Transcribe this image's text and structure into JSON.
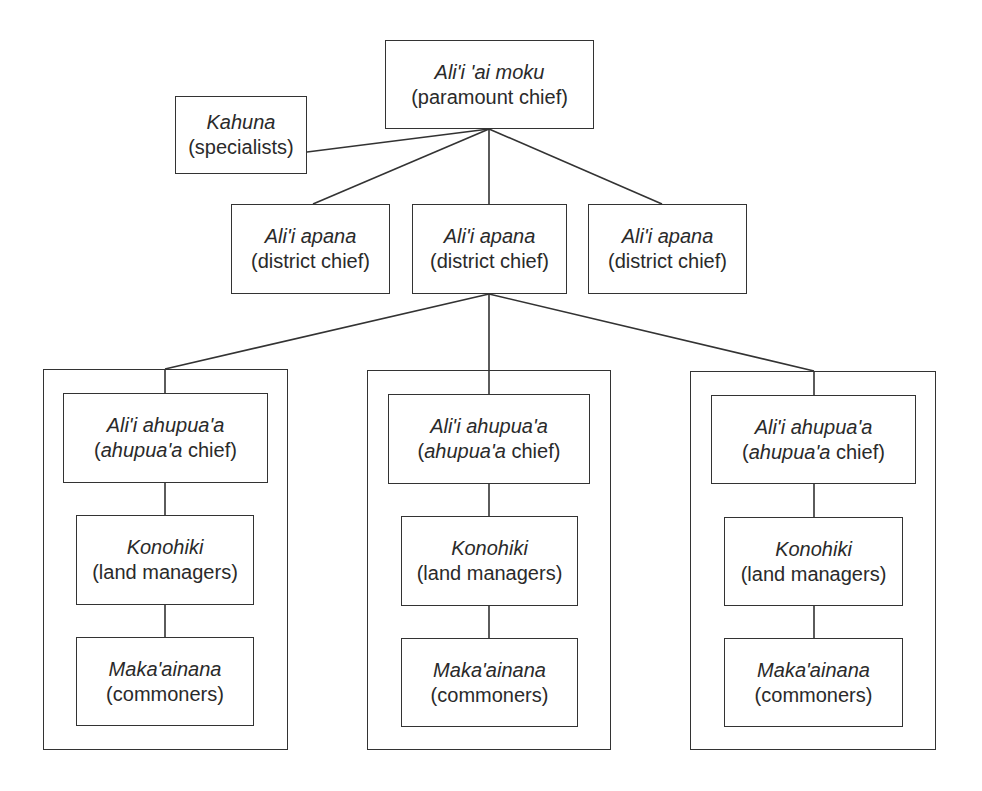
{
  "diagram": {
    "type": "hierarchy",
    "paramount": {
      "name": "Ali'i 'ai moku",
      "role": "(paramount chief)"
    },
    "kahuna": {
      "name": "Kahuna",
      "role": "(specialists)"
    },
    "districts": [
      {
        "name": "Ali'i apana",
        "role": "(district chief)"
      },
      {
        "name": "Ali'i apana",
        "role": "(district chief)"
      },
      {
        "name": "Ali'i apana",
        "role": "(district chief)"
      }
    ],
    "ahupuaa_units": [
      {
        "chief": {
          "name": "Ali'i ahupua'a",
          "role_prefix": "(",
          "role_italic": "ahupua'a",
          "role_suffix": " chief)"
        },
        "konohiki": {
          "name": "Konohiki",
          "role": "(land managers)"
        },
        "commoners": {
          "name": "Maka'ainana",
          "role": "(commoners)"
        }
      },
      {
        "chief": {
          "name": "Ali'i ahupua'a",
          "role_prefix": "(",
          "role_italic": "ahupua'a",
          "role_suffix": " chief)"
        },
        "konohiki": {
          "name": "Konohiki",
          "role": "(land managers)"
        },
        "commoners": {
          "name": "Maka'ainana",
          "role": "(commoners)"
        }
      },
      {
        "chief": {
          "name": "Ali'i ahupua'a",
          "role_prefix": "(",
          "role_italic": "ahupua'a",
          "role_suffix": " chief)"
        },
        "konohiki": {
          "name": "Konohiki",
          "role": "(land managers)"
        },
        "commoners": {
          "name": "Maka'ainana",
          "role": "(commoners)"
        }
      }
    ]
  }
}
